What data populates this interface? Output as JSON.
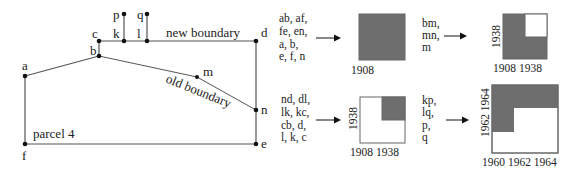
{
  "parcel_map": {
    "points": {
      "a": "a",
      "b": "b",
      "c": "c",
      "d": "d",
      "e": "e",
      "f": "f",
      "k": "k",
      "l": "l",
      "m": "m",
      "n": "n",
      "p": "p",
      "q": "q"
    },
    "labels": {
      "new_boundary": "new boundary",
      "old_boundary": "old boundary",
      "parcel": "parcel 4"
    }
  },
  "transitions": [
    {
      "elements": [
        "ab, af,",
        "fe, en,",
        "a, b,",
        "e, f, n"
      ],
      "box": {
        "x_labels": [
          "1908"
        ],
        "y_labels": []
      }
    },
    {
      "elements": [
        "bm,",
        "mn,",
        "m"
      ],
      "box": {
        "x_labels": [
          "1908 1938"
        ],
        "y_labels": [
          "1938"
        ]
      }
    },
    {
      "elements": [
        "nd, dl,",
        "lk, kc,",
        "cb, d,",
        "l, k, c"
      ],
      "box": {
        "x_labels": [
          "1908 1938"
        ],
        "y_labels": [
          "1938"
        ]
      }
    },
    {
      "elements": [
        "kp,",
        "lq,",
        "p,",
        "q"
      ],
      "box": {
        "x_labels": [
          "1960 1962 1964"
        ],
        "y_labels": [
          "1962 1964"
        ]
      }
    }
  ],
  "colors": {
    "lifespan_fill": "#6e6e6e",
    "line": "#555555",
    "point": "#111111"
  }
}
